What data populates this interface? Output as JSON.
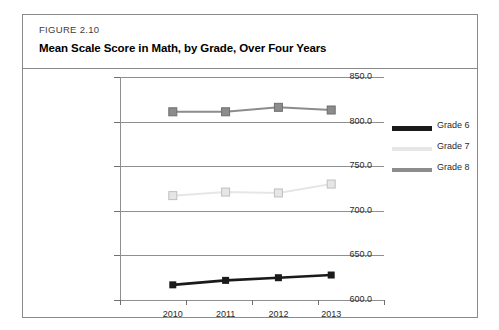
{
  "figure": {
    "number": "FIGURE 2.10",
    "title": "Mean Scale Score in Math, by Grade, Over Four Years"
  },
  "legend": {
    "position": "right",
    "items": [
      {
        "label": "Grade 6",
        "color": "#1a1a1a"
      },
      {
        "label": "Grade 7",
        "color": "#e6e6e6"
      },
      {
        "label": "Grade 8",
        "color": "#8c8c8c"
      }
    ]
  },
  "chart_data": {
    "type": "line",
    "title": "Mean Scale Score in Math, by Grade, Over Four Years",
    "xlabel": "",
    "ylabel": "",
    "categories": [
      "2010",
      "2011",
      "2012",
      "2013"
    ],
    "x": [
      2010,
      2011,
      2012,
      2013
    ],
    "series": [
      {
        "name": "Grade 6",
        "color": "#1a1a1a",
        "values": [
          617,
          622,
          625,
          628
        ]
      },
      {
        "name": "Grade 7",
        "color": "#e6e6e6",
        "values": [
          717,
          721,
          720,
          730
        ]
      },
      {
        "name": "Grade 8",
        "color": "#8c8c8c",
        "values": [
          811,
          811,
          816,
          813
        ]
      }
    ],
    "ylim": [
      600,
      850
    ],
    "yticks": [
      600.0,
      650.0,
      700.0,
      750.0,
      800.0,
      850.0
    ],
    "ytick_labels": [
      "600.0",
      "650.0",
      "700.0",
      "750.0",
      "800.0",
      "850.0"
    ],
    "xtick_labels": [
      "2010",
      "2011",
      "2012",
      "2013"
    ],
    "grid": true,
    "marker": "square",
    "legend_position": "right"
  }
}
